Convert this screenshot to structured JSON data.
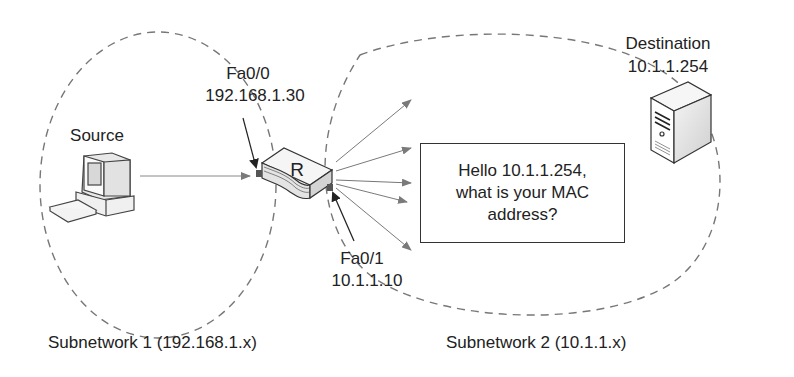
{
  "subnets": [
    {
      "label": "Subnetwork 1 (192.168.1.x)"
    },
    {
      "label": "Subnetwork 2 (10.1.1.x)"
    }
  ],
  "source": {
    "label": "Source",
    "icon": "desktop-computer-icon"
  },
  "destination": {
    "label": "Destination",
    "ip": "10.1.1.254",
    "icon": "server-tower-icon"
  },
  "router": {
    "label": "R",
    "icon": "router-icon"
  },
  "interfaces": [
    {
      "name": "Fa0/0",
      "ip": "192.168.1.30"
    },
    {
      "name": "Fa0/1",
      "ip": "10.1.1.10"
    }
  ],
  "message": {
    "lines": [
      "Hello 10.1.1.254,",
      "what is your MAC",
      "address?"
    ]
  },
  "colors": {
    "dashed_boundary": "#777777",
    "broadcast_arrow": "#777777",
    "pointer_arrow": "#333333",
    "text": "#222222"
  }
}
